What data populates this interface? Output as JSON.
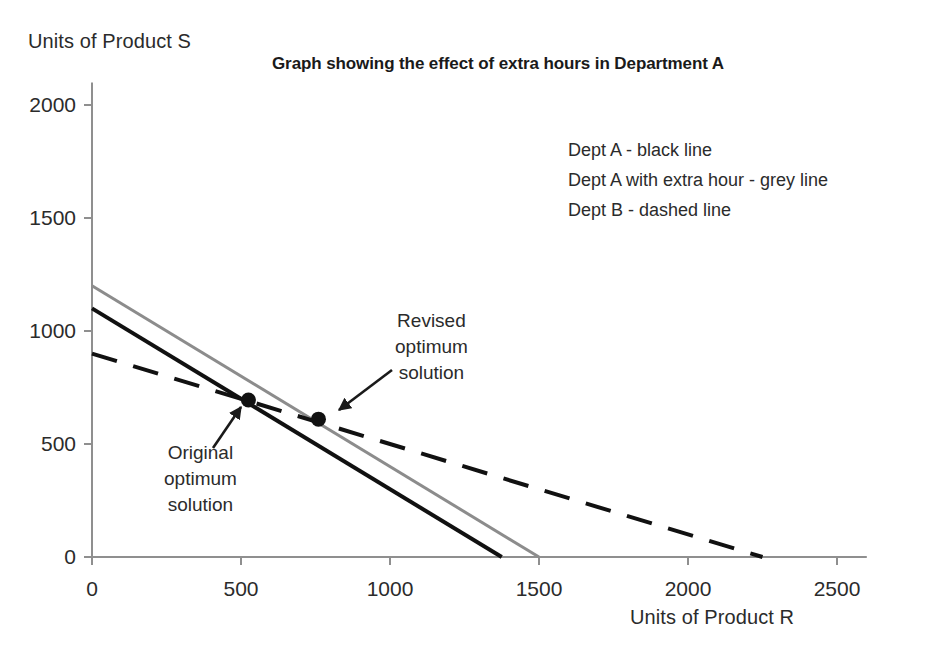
{
  "chart_data": {
    "type": "line",
    "title": "Graph showing the effect of extra hours in Department A",
    "xlabel": "Units of Product R",
    "ylabel": "Units of Product S",
    "xlim": [
      0,
      2600
    ],
    "ylim": [
      0,
      2100
    ],
    "xticks": [
      0,
      500,
      1000,
      1500,
      2000,
      2500
    ],
    "yticks": [
      0,
      500,
      1000,
      1500,
      2000
    ],
    "xtick_labels": [
      "0",
      "500",
      "1000",
      "1500",
      "2000",
      "2500"
    ],
    "ytick_labels": [
      "0",
      "500",
      "1000",
      "1500",
      "2000"
    ],
    "grid": false,
    "legend_position": "upper-right-text-block",
    "series": [
      {
        "name": "Dept A",
        "style": "solid",
        "color": "#111111",
        "width": 4,
        "x": [
          0,
          1375
        ],
        "y": [
          1100,
          0
        ]
      },
      {
        "name": "Dept A with extra hour",
        "style": "solid",
        "color": "#8c8c8c",
        "width": 3,
        "x": [
          0,
          1500
        ],
        "y": [
          1200,
          0
        ]
      },
      {
        "name": "Dept B",
        "style": "dashed",
        "color": "#111111",
        "width": 4,
        "x": [
          0,
          2250
        ],
        "y": [
          900,
          0
        ]
      }
    ],
    "points": [
      {
        "name": "Original optimum solution",
        "x": 525,
        "y": 695
      },
      {
        "name": "Revised optimum solution",
        "x": 760,
        "y": 610
      }
    ],
    "annotations": [
      {
        "name": "original-optimum",
        "lines": [
          "Original",
          "optimum",
          "solution"
        ],
        "target_x": 525,
        "target_y": 695
      },
      {
        "name": "revised-optimum",
        "lines": [
          "Revised",
          "optimum",
          "solution"
        ],
        "target_x": 760,
        "target_y": 610
      }
    ]
  },
  "legend": {
    "lines": [
      "Dept A - black line",
      "Dept A with extra hour - grey line",
      "Dept B - dashed line"
    ]
  },
  "colors": {
    "black_line": "#111111",
    "grey_line": "#8c8c8c",
    "axis": "#8f8f8f",
    "text": "#2b2b2b"
  }
}
